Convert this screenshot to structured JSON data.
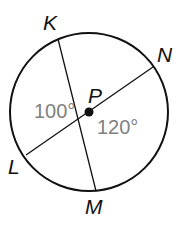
{
  "diagram": {
    "type": "circle-with-chords",
    "center": {
      "label": "P",
      "x": 89,
      "y": 112
    },
    "radius": 79,
    "points": [
      {
        "label": "K",
        "x": 58,
        "y": 39
      },
      {
        "label": "N",
        "x": 153,
        "y": 67
      },
      {
        "label": "L",
        "x": 26,
        "y": 155
      },
      {
        "label": "M",
        "x": 96,
        "y": 191
      }
    ],
    "segments": [
      {
        "from": "K",
        "to": "M"
      },
      {
        "from": "L",
        "to": "N"
      }
    ],
    "angles": [
      {
        "label": "100°",
        "between": [
          "K",
          "L"
        ]
      },
      {
        "label": "120°",
        "between": [
          "N",
          "M"
        ]
      }
    ],
    "colors": {
      "stroke": "#111111",
      "angle_text": "#808080"
    }
  }
}
